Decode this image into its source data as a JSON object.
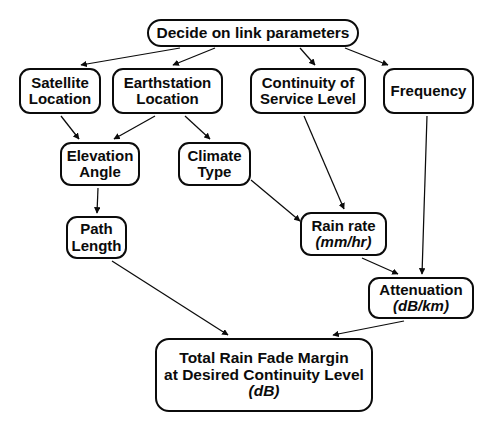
{
  "diagram": {
    "canvas": {
      "width": 489,
      "height": 428
    },
    "stroke_color": "#0b0b0b",
    "background_color": "#ffffff",
    "nodes": {
      "decide": {
        "label": "Decide on link parameters"
      },
      "satellite": {
        "line1": "Satellite",
        "line2": "Location"
      },
      "earthstation": {
        "line1": "Earthstation",
        "line2": "Location"
      },
      "continuity": {
        "line1": "Continuity of",
        "line2": "Service Level"
      },
      "frequency": {
        "line1": "Frequency"
      },
      "elevation": {
        "line1": "Elevation",
        "line2": "Angle"
      },
      "climate": {
        "line1": "Climate",
        "line2": "Type"
      },
      "pathlength": {
        "line1": "Path",
        "line2": "Length"
      },
      "rainrate": {
        "line1": "Rain rate",
        "unit": "(mm/hr)"
      },
      "attenuation": {
        "line1": "Attenuation",
        "unit": "(dB/km)"
      },
      "total": {
        "line1": "Total Rain Fade Margin",
        "line2": "at Desired Continuity Level",
        "unit": "(dB)"
      }
    },
    "edges": [
      {
        "from": "decide",
        "to": "satellite"
      },
      {
        "from": "decide",
        "to": "earthstation"
      },
      {
        "from": "decide",
        "to": "continuity"
      },
      {
        "from": "decide",
        "to": "frequency"
      },
      {
        "from": "satellite",
        "to": "elevation"
      },
      {
        "from": "earthstation",
        "to": "elevation"
      },
      {
        "from": "earthstation",
        "to": "climate"
      },
      {
        "from": "elevation",
        "to": "pathlength"
      },
      {
        "from": "climate",
        "to": "rainrate"
      },
      {
        "from": "continuity",
        "to": "rainrate"
      },
      {
        "from": "frequency",
        "to": "attenuation"
      },
      {
        "from": "rainrate",
        "to": "attenuation"
      },
      {
        "from": "pathlength",
        "to": "total"
      },
      {
        "from": "attenuation",
        "to": "total"
      }
    ]
  }
}
